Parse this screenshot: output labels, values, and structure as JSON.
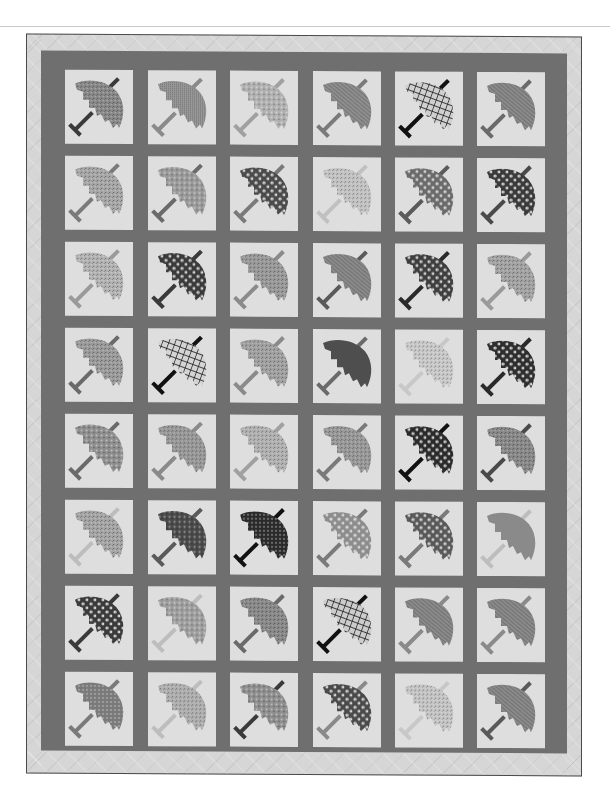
{
  "image": {
    "subject": "Umbrella block quilt, black and white photograph",
    "background": "#ffffff",
    "colors": {
      "border_light": "#d6d6d6",
      "sashing": "#6f6f6f",
      "block_bg": "#dedede",
      "edge": "#4a4a4a"
    },
    "grid": {
      "columns": 6,
      "rows": 8
    },
    "blocks": [
      {
        "row": 1,
        "col": 1,
        "fill": "#8a8a8a",
        "pattern": "speckle",
        "handle": "#3a3a3a"
      },
      {
        "row": 1,
        "col": 2,
        "fill": "#9a9a9a",
        "pattern": "fine-check",
        "handle": "#8a8a8a"
      },
      {
        "row": 1,
        "col": 3,
        "fill": "#b0b0b0",
        "pattern": "floral",
        "handle": "#a0a0a0"
      },
      {
        "row": 1,
        "col": 4,
        "fill": "#8e8e8e",
        "pattern": "stripe",
        "handle": "#7a7a7a"
      },
      {
        "row": 1,
        "col": 5,
        "fill": "#d0d0d0",
        "pattern": "plaid",
        "handle": "#111111"
      },
      {
        "row": 1,
        "col": 6,
        "fill": "#8a8a8a",
        "pattern": "stripe",
        "handle": "#6a6a6a"
      },
      {
        "row": 2,
        "col": 1,
        "fill": "#a8a8a8",
        "pattern": "speckle",
        "handle": "#7a7a7a"
      },
      {
        "row": 2,
        "col": 2,
        "fill": "#9a9a9a",
        "pattern": "floral",
        "handle": "#6a6a6a"
      },
      {
        "row": 2,
        "col": 3,
        "fill": "#4a4a4a",
        "pattern": "daisy",
        "handle": "#7a7a7a"
      },
      {
        "row": 2,
        "col": 4,
        "fill": "#c4c4c4",
        "pattern": "speckle",
        "handle": "#c0c0c0"
      },
      {
        "row": 2,
        "col": 5,
        "fill": "#6a6a6a",
        "pattern": "daisy",
        "handle": "#5a5a5a"
      },
      {
        "row": 2,
        "col": 6,
        "fill": "#3a3a3a",
        "pattern": "daisy",
        "handle": "#4a4a4a"
      },
      {
        "row": 3,
        "col": 1,
        "fill": "#b4b4b4",
        "pattern": "speckle",
        "handle": "#9a9a9a"
      },
      {
        "row": 3,
        "col": 2,
        "fill": "#3a3a3a",
        "pattern": "daisy",
        "handle": "#3a3a3a"
      },
      {
        "row": 3,
        "col": 3,
        "fill": "#9a9a9a",
        "pattern": "speckle",
        "handle": "#8a8a8a"
      },
      {
        "row": 3,
        "col": 4,
        "fill": "#8a8a8a",
        "pattern": "stripe",
        "handle": "#5a5a5a"
      },
      {
        "row": 3,
        "col": 5,
        "fill": "#3e3e3e",
        "pattern": "daisy",
        "handle": "#2a2a2a"
      },
      {
        "row": 3,
        "col": 6,
        "fill": "#a4a4a4",
        "pattern": "speckle",
        "handle": "#9a9a9a"
      },
      {
        "row": 4,
        "col": 1,
        "fill": "#9c9c9c",
        "pattern": "speckle",
        "handle": "#6a6a6a"
      },
      {
        "row": 4,
        "col": 2,
        "fill": "#d4d4d4",
        "pattern": "plaid",
        "handle": "#111111"
      },
      {
        "row": 4,
        "col": 3,
        "fill": "#a2a2a2",
        "pattern": "speckle",
        "handle": "#8a8a8a"
      },
      {
        "row": 4,
        "col": 4,
        "fill": "#4e4e4e",
        "pattern": "solid",
        "handle": "#6a6a6a"
      },
      {
        "row": 4,
        "col": 5,
        "fill": "#cacaca",
        "pattern": "speckle",
        "handle": "#c8c8c8"
      },
      {
        "row": 4,
        "col": 6,
        "fill": "#2e2e2e",
        "pattern": "daisy",
        "handle": "#2a2a2a"
      },
      {
        "row": 5,
        "col": 1,
        "fill": "#8e8e8e",
        "pattern": "floral",
        "handle": "#6a6a6a"
      },
      {
        "row": 5,
        "col": 2,
        "fill": "#9a9a9a",
        "pattern": "speckle",
        "handle": "#8a8a8a"
      },
      {
        "row": 5,
        "col": 3,
        "fill": "#b2b2b2",
        "pattern": "speckle",
        "handle": "#a0a0a0"
      },
      {
        "row": 5,
        "col": 4,
        "fill": "#9a9a9a",
        "pattern": "speckle",
        "handle": "#7a7a7a"
      },
      {
        "row": 5,
        "col": 5,
        "fill": "#2a2a2a",
        "pattern": "daisy",
        "handle": "#111111"
      },
      {
        "row": 5,
        "col": 6,
        "fill": "#8a8a8a",
        "pattern": "speckle",
        "handle": "#4a4a4a"
      },
      {
        "row": 6,
        "col": 1,
        "fill": "#a6a6a6",
        "pattern": "speckle",
        "handle": "#bdbdbd"
      },
      {
        "row": 6,
        "col": 2,
        "fill": "#4a4a4a",
        "pattern": "floral",
        "handle": "#5a5a5a"
      },
      {
        "row": 6,
        "col": 3,
        "fill": "#2a2a2a",
        "pattern": "dots",
        "handle": "#111111"
      },
      {
        "row": 6,
        "col": 4,
        "fill": "#8c8c8c",
        "pattern": "daisy",
        "handle": "#7a7a7a"
      },
      {
        "row": 6,
        "col": 5,
        "fill": "#585858",
        "pattern": "daisy",
        "handle": "#7a7a7a"
      },
      {
        "row": 6,
        "col": 6,
        "fill": "#8a8a8a",
        "pattern": "solid",
        "handle": "#bdbdbd"
      },
      {
        "row": 7,
        "col": 1,
        "fill": "#3a3a3a",
        "pattern": "daisy",
        "handle": "#3a3a3a"
      },
      {
        "row": 7,
        "col": 2,
        "fill": "#9e9e9e",
        "pattern": "floral",
        "handle": "#bdbdbd"
      },
      {
        "row": 7,
        "col": 3,
        "fill": "#8a8a8a",
        "pattern": "speckle",
        "handle": "#6a6a6a"
      },
      {
        "row": 7,
        "col": 4,
        "fill": "#cccccc",
        "pattern": "plaid",
        "handle": "#111111"
      },
      {
        "row": 7,
        "col": 5,
        "fill": "#8a8a8a",
        "pattern": "stripe",
        "handle": "#8a8a8a"
      },
      {
        "row": 7,
        "col": 6,
        "fill": "#8a8a8a",
        "pattern": "stripe",
        "handle": "#8a8a8a"
      },
      {
        "row": 8,
        "col": 1,
        "fill": "#7a7a7a",
        "pattern": "dots",
        "handle": "#7a7a7a"
      },
      {
        "row": 8,
        "col": 2,
        "fill": "#b0b0b0",
        "pattern": "speckle",
        "handle": "#bdbdbd"
      },
      {
        "row": 8,
        "col": 3,
        "fill": "#8e8e8e",
        "pattern": "floral",
        "handle": "#3a3a3a"
      },
      {
        "row": 8,
        "col": 4,
        "fill": "#4a4a4a",
        "pattern": "daisy",
        "handle": "#8a8a8a"
      },
      {
        "row": 8,
        "col": 5,
        "fill": "#c6c6c6",
        "pattern": "speckle",
        "handle": "#c8c8c8"
      },
      {
        "row": 8,
        "col": 6,
        "fill": "#8a8a8a",
        "pattern": "stripe",
        "handle": "#5a5a5a"
      }
    ]
  }
}
